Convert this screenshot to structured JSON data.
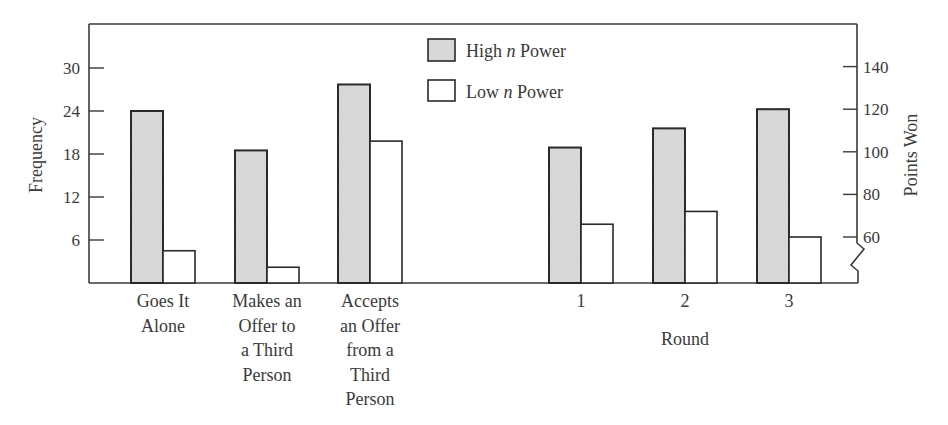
{
  "chart_data": [
    {
      "type": "bar",
      "title": "",
      "xlabel": "",
      "ylabel": "Frequency",
      "ylim": [
        0,
        36
      ],
      "yticks": [
        6,
        12,
        18,
        24,
        30
      ],
      "categories": [
        "Goes It Alone",
        "Makes an Offer to a Third Person",
        "Accepts an Offer from a Third Person"
      ],
      "category_lines": [
        [
          "Goes It",
          "Alone"
        ],
        [
          "Makes an",
          "Offer to",
          "a Third",
          "Person"
        ],
        [
          "Accepts",
          "an Offer",
          "from a",
          "Third",
          "Person"
        ]
      ],
      "series": [
        {
          "name": "High n Power",
          "values": [
            24,
            18.5,
            27.7
          ]
        },
        {
          "name": "Low n Power",
          "values": [
            4.5,
            2.2,
            19.8
          ]
        }
      ],
      "grid": false
    },
    {
      "type": "bar",
      "title": "",
      "xlabel": "Round",
      "ylabel": "Points Won",
      "ylim": [
        40,
        160
      ],
      "yticks": [
        60,
        80,
        100,
        120,
        140
      ],
      "axis_break": true,
      "categories": [
        "1",
        "2",
        "3"
      ],
      "series": [
        {
          "name": "High n Power",
          "values": [
            102,
            111,
            120
          ]
        },
        {
          "name": "Low n Power",
          "values": [
            66,
            72,
            60
          ]
        }
      ],
      "grid": false
    }
  ],
  "legend": {
    "position": "top-center",
    "items": [
      {
        "prefix": "High ",
        "italic": "n",
        "suffix": " Power",
        "fill": "#d9d9d9"
      },
      {
        "prefix": "Low ",
        "italic": "n",
        "suffix": " Power",
        "fill": "#ffffff"
      }
    ]
  },
  "axes": {
    "left_label": "Frequency",
    "right_label": "Points Won",
    "round_label": "Round"
  },
  "colors": {
    "high_fill": "#d9d9d9",
    "low_fill": "#ffffff",
    "stroke": "#2a2a2a"
  }
}
